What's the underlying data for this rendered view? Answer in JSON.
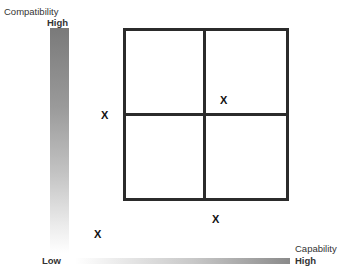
{
  "diagram": {
    "type": "2x2 matrix",
    "y_axis": {
      "title": "Compatibility",
      "high_label": "High",
      "low_label": "Low",
      "gradient_colors": [
        "#7a7a7a",
        "#ffffff"
      ]
    },
    "x_axis": {
      "title": "Capability",
      "high_label": "High",
      "low_label": "Low",
      "gradient_colors": [
        "#ffffff",
        "#8a8a8a"
      ]
    },
    "grid": {
      "rows": 2,
      "cols": 2,
      "line_color": "#2b2b2b"
    },
    "markers": [
      {
        "label": "X",
        "position": "upper-right quadrant near center"
      },
      {
        "label": "X",
        "position": "left of grid at midline"
      },
      {
        "label": "X",
        "position": "below grid near center"
      },
      {
        "label": "X",
        "position": "bottom-left near origin"
      }
    ]
  }
}
